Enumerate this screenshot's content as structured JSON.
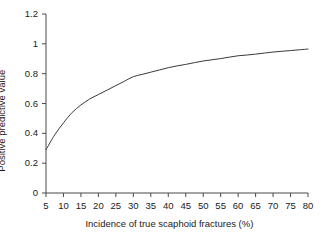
{
  "chart_data": {
    "type": "line",
    "title": "",
    "xlabel": "Incidence of true scaphoid fractures (%)",
    "ylabel": "Positive predictive value",
    "xlim": [
      5,
      80
    ],
    "ylim": [
      0,
      1.2
    ],
    "grid": false,
    "legend": null,
    "xticks": [
      5,
      10,
      15,
      20,
      25,
      30,
      35,
      40,
      45,
      50,
      55,
      60,
      65,
      70,
      75,
      80
    ],
    "xtick_labels": [
      "5",
      "10",
      "15",
      "20",
      "25",
      "30",
      "35",
      "40",
      "45",
      "50",
      "55",
      "60",
      "65",
      "70",
      "75",
      "80"
    ],
    "yticks": [
      0,
      0.2,
      0.4,
      0.6,
      0.8,
      1,
      1.2
    ],
    "ytick_labels": [
      "0",
      "0.2",
      "0.4",
      "0.6",
      "0.8",
      "1",
      "1.2"
    ],
    "line_color": "#3a3a3a",
    "line_width": 1,
    "x": [
      5,
      7.5,
      10,
      12.5,
      15,
      17.5,
      20,
      22.5,
      25,
      27.5,
      30,
      32.5,
      35,
      37.5,
      40,
      42.5,
      45,
      47.5,
      50,
      52.5,
      55,
      57.5,
      60,
      62.5,
      65,
      67.5,
      70,
      72.5,
      75,
      77.5,
      80
    ],
    "y": [
      0.29,
      0.39,
      0.47,
      0.54,
      0.59,
      0.63,
      0.66,
      0.69,
      0.72,
      0.75,
      0.78,
      0.795,
      0.81,
      0.825,
      0.84,
      0.852,
      0.862,
      0.874,
      0.885,
      0.893,
      0.901,
      0.911,
      0.92,
      0.925,
      0.931,
      0.938,
      0.945,
      0.95,
      0.955,
      0.96,
      0.965
    ]
  },
  "axes": {
    "x_axis_title": "Incidence of true scaphoid fractures (%)",
    "y_axis_title": "Positive predictive value"
  }
}
